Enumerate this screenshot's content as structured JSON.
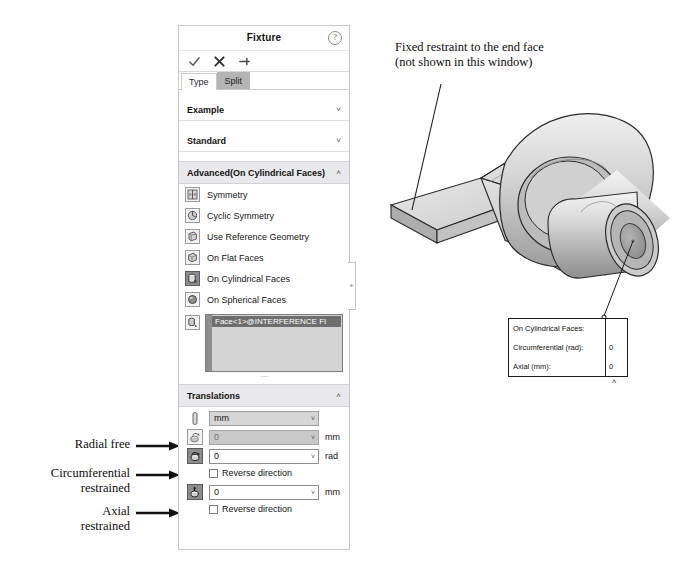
{
  "panel": {
    "title": "Fixture",
    "help_icon": "help-circle-icon",
    "actions": [
      {
        "name": "accept-button",
        "icon": "check-icon"
      },
      {
        "name": "cancel-button",
        "icon": "x-icon"
      },
      {
        "name": "pin-button",
        "icon": "pushpin-icon"
      }
    ],
    "tabs": [
      {
        "label": "Type",
        "active": true
      },
      {
        "label": "Split",
        "active": false
      }
    ],
    "sections": [
      {
        "label": "Example",
        "expanded": false,
        "chevron": "chevron-down-icon"
      },
      {
        "label": "Standard",
        "expanded": false,
        "chevron": "chevron-down-icon"
      },
      {
        "label": "Advanced(On Cylindrical Faces)",
        "expanded": true,
        "chevron": "chevron-up-icon"
      }
    ],
    "advanced_options": [
      {
        "label": "Symmetry",
        "icon": "symmetry-icon",
        "selected": false
      },
      {
        "label": "Cyclic Symmetry",
        "icon": "cyclic-symmetry-icon",
        "selected": false
      },
      {
        "label": "Use Reference Geometry",
        "icon": "reference-geometry-icon",
        "selected": false
      },
      {
        "label": "On Flat Faces",
        "icon": "flat-faces-icon",
        "selected": false
      },
      {
        "label": "On Cylindrical Faces",
        "icon": "cylindrical-faces-icon",
        "selected": true
      },
      {
        "label": "On Spherical Faces",
        "icon": "spherical-faces-icon",
        "selected": false
      }
    ],
    "face_selection": {
      "icon": "face-picker-icon",
      "selected_entity": "Face<1>@INTERFERENCE FI"
    },
    "translations": {
      "header": "Translations",
      "chevron": "chevron-up-icon",
      "unit_row": {
        "icon": "units-icon",
        "value": "mm",
        "arrow": "chevron-down-icon"
      },
      "rows": [
        {
          "name": "radial",
          "icon": "radial-icon",
          "value": "0",
          "unit": "mm",
          "enabled": false,
          "selected": false,
          "reverse_label": null,
          "reverse_checked": false
        },
        {
          "name": "circumferential",
          "icon": "circumferential-icon",
          "value": "0",
          "unit": "rad",
          "enabled": true,
          "selected": true,
          "reverse_label": "Reverse direction",
          "reverse_checked": false
        },
        {
          "name": "axial",
          "icon": "axial-icon",
          "value": "0",
          "unit": "mm",
          "enabled": true,
          "selected": true,
          "reverse_label": "Reverse direction",
          "reverse_checked": false
        }
      ]
    }
  },
  "annotations": {
    "fixed_restraint": "Fixed restraint to the end face\n(not shown in this window)",
    "fixed_restraint_line1": "Fixed restraint to the end face",
    "fixed_restraint_line2": "(not shown in this window)",
    "radial": "Radial free",
    "circumferential_l1": "Circumferential",
    "circumferential_l2": "restrained",
    "axial_l1": "Axial",
    "axial_l2": "restrained"
  },
  "callout": {
    "rows": [
      {
        "label": "On Cylindrical Faces:",
        "value": ""
      },
      {
        "label": "Circumferential (rad):",
        "value": "0"
      },
      {
        "label": "Axial (mm):",
        "value": "0"
      }
    ],
    "caret": "chevron-up-icon"
  },
  "model": {
    "name": "bracket-lever-3d-model",
    "colors": {
      "light": "#e2e2e2",
      "mid": "#c3c3c3",
      "dark": "#9b9b9b",
      "darker": "#7d7d7d",
      "outline": "#2a2a2a"
    }
  }
}
